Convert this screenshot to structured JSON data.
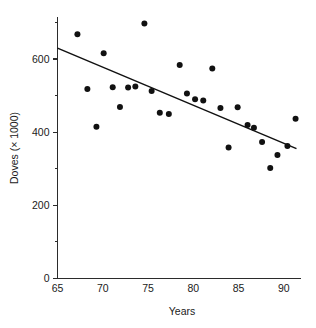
{
  "chart_data": {
    "type": "scatter",
    "title": "",
    "subtitle": "",
    "xlabel": "Years",
    "ylabel": "Doves (× 1000)",
    "xlim": [
      65,
      91.9
    ],
    "ylim": [
      0,
      715
    ],
    "grid": false,
    "legend": null,
    "x_ticks_major": [
      65,
      70,
      75,
      80,
      85,
      90
    ],
    "x_tick_labels": [
      "65",
      "70",
      "75",
      "80",
      "85",
      "90"
    ],
    "y_ticks_major": [
      0,
      200,
      400,
      600
    ],
    "y_tick_labels": [
      "0",
      "200",
      "400",
      "600"
    ],
    "y_ticks_minor": [
      100,
      300,
      500,
      700
    ],
    "point_color": "#111111",
    "line_color": "#111111",
    "axis_color": "#2b2b2b",
    "marker_size": 3.0,
    "points": [
      {
        "x": 67.2,
        "y": 668
      },
      {
        "x": 68.3,
        "y": 518
      },
      {
        "x": 69.3,
        "y": 415
      },
      {
        "x": 70.1,
        "y": 616
      },
      {
        "x": 71.1,
        "y": 523
      },
      {
        "x": 71.9,
        "y": 469
      },
      {
        "x": 72.8,
        "y": 522
      },
      {
        "x": 73.6,
        "y": 525
      },
      {
        "x": 74.6,
        "y": 697
      },
      {
        "x": 75.4,
        "y": 513
      },
      {
        "x": 76.3,
        "y": 453
      },
      {
        "x": 77.3,
        "y": 450
      },
      {
        "x": 78.5,
        "y": 584
      },
      {
        "x": 79.3,
        "y": 506
      },
      {
        "x": 80.2,
        "y": 490
      },
      {
        "x": 81.1,
        "y": 487
      },
      {
        "x": 82.1,
        "y": 574
      },
      {
        "x": 83.0,
        "y": 466
      },
      {
        "x": 83.9,
        "y": 358
      },
      {
        "x": 84.9,
        "y": 468
      },
      {
        "x": 86.0,
        "y": 420
      },
      {
        "x": 86.7,
        "y": 412
      },
      {
        "x": 87.6,
        "y": 373
      },
      {
        "x": 88.5,
        "y": 302
      },
      {
        "x": 89.3,
        "y": 338
      },
      {
        "x": 90.4,
        "y": 362
      },
      {
        "x": 91.3,
        "y": 437
      }
    ],
    "trend_line": {
      "kind": "linear-fit",
      "x_start": 65,
      "y_start": 630,
      "x_end": 91.4,
      "y_end": 355
    }
  }
}
